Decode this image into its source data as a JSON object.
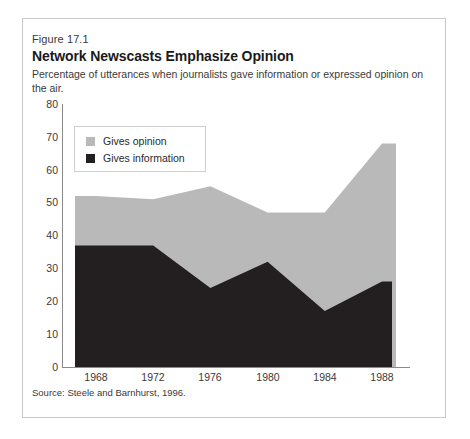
{
  "figure": {
    "label": "Figure 17.1",
    "title": "Network Newscasts Emphasize Opinion",
    "subtitle": "Percentage of utterances when journalists gave information or expressed opinion on the air.",
    "source": "Source: Steele and Barnhurst, 1996."
  },
  "legend": {
    "position": "top-left-inside",
    "items": [
      {
        "label": "Gives opinion",
        "color": "#b9b9b9",
        "swatch": "opinion-swatch"
      },
      {
        "label": "Gives information",
        "color": "#231f20",
        "swatch": "information-swatch"
      }
    ]
  },
  "axes": {
    "y_ticks": [
      "80",
      "70",
      "60",
      "50",
      "40",
      "30",
      "20",
      "10",
      "0"
    ],
    "x_ticks": [
      "1968",
      "1972",
      "1976",
      "1980",
      "1984",
      "1988"
    ]
  },
  "colors": {
    "opinion": "#b9b9b9",
    "information": "#231f20",
    "frame": "#c9c9c9",
    "axis": "#8a8a8a",
    "background": "#ffffff"
  },
  "chart_data": {
    "type": "area",
    "stacked": true,
    "title": "Network Newscasts Emphasize Opinion",
    "subtitle": "Percentage of utterances when journalists gave information or expressed opinion on the air.",
    "xlabel": "",
    "ylabel": "",
    "ylim": [
      0,
      80
    ],
    "ytick_step": 10,
    "grid": false,
    "legend_position": "inside top-left",
    "categories": [
      "1968",
      "1972",
      "1976",
      "1980",
      "1984",
      "1988"
    ],
    "series": [
      {
        "name": "Gives information",
        "color": "#231f20",
        "values": [
          37,
          37,
          24,
          32,
          17,
          26
        ]
      },
      {
        "name": "Gives opinion",
        "color": "#b9b9b9",
        "values": [
          15,
          14,
          31,
          15,
          30,
          42
        ]
      }
    ],
    "totals": [
      52,
      51,
      55,
      47,
      47,
      68
    ],
    "note": "Areas begin flat to the left of 1968 and extend flat past 1988.",
    "source": "Source: Steele and Barnhurst, 1996."
  }
}
